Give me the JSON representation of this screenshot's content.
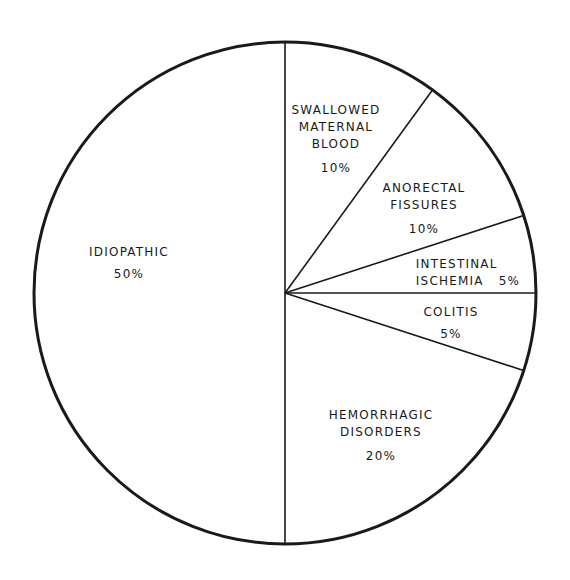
{
  "chart_data": {
    "type": "pie",
    "title": "",
    "start_angle_deg": 90,
    "direction": "clockwise",
    "slices": [
      {
        "label": "SWALLOWED MATERNAL BLOOD",
        "lines": [
          "SWALLOWED",
          "MATERNAL",
          "BLOOD"
        ],
        "value": 10,
        "pct_label": "10%"
      },
      {
        "label": "ANORECTAL FISSURES",
        "lines": [
          "ANORECTAL",
          "FISSURES"
        ],
        "value": 10,
        "pct_label": "10%"
      },
      {
        "label": "INTESTINAL ISCHEMIA",
        "lines": [
          "INTESTINAL",
          "ISCHEMIA"
        ],
        "value": 5,
        "pct_label": "5%"
      },
      {
        "label": "COLITIS",
        "lines": [
          "COLITIS"
        ],
        "value": 5,
        "pct_label": "5%"
      },
      {
        "label": "HEMORRHAGIC DISORDERS",
        "lines": [
          "HEMORRHAGIC",
          "DISORDERS"
        ],
        "value": 20,
        "pct_label": "20%"
      },
      {
        "label": "IDIOPATHIC",
        "lines": [
          "IDIOPATHIC"
        ],
        "value": 50,
        "pct_label": "50%"
      }
    ],
    "colors": {
      "stroke": "#1a1a1a",
      "fill": "#ffffff"
    }
  }
}
